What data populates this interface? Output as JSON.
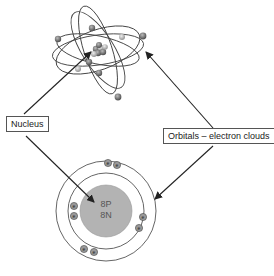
{
  "diagram": {
    "labels": {
      "nucleus": "Nucleus",
      "orbitals": "Orbitals – electron clouds"
    },
    "bohr_model": {
      "nucleus_protons": "8P",
      "nucleus_neutrons": "8N",
      "electron_symbol": "e",
      "inner_shell_electrons": 2,
      "outer_shell_electrons": 6
    },
    "colors": {
      "nucleus_fill": "#b3b3b3",
      "electron_fill": "#8a8a8a",
      "line": "#333333"
    }
  }
}
